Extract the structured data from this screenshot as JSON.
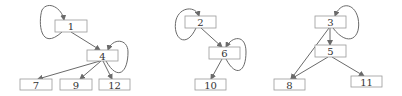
{
  "diagram": {
    "type": "directed-graph",
    "colors": {
      "node_border": "#9a9a9a",
      "edge": "#6a6a6a",
      "text": "#333333",
      "background": "#ffffff"
    },
    "graphs": [
      {
        "nodes": [
          {
            "id": "1",
            "label": "1",
            "x": 55,
            "y": 20
          },
          {
            "id": "4",
            "label": "4",
            "x": 87,
            "y": 50
          },
          {
            "id": "7",
            "label": "7",
            "x": 20,
            "y": 79
          },
          {
            "id": "9",
            "label": "9",
            "x": 60,
            "y": 79
          },
          {
            "id": "12",
            "label": "12",
            "x": 99,
            "y": 79
          }
        ],
        "edges": [
          {
            "from": "1",
            "to": "1",
            "self_loop": true
          },
          {
            "from": "1",
            "to": "4"
          },
          {
            "from": "4",
            "to": "4",
            "self_loop": true
          },
          {
            "from": "4",
            "to": "7"
          },
          {
            "from": "4",
            "to": "9"
          },
          {
            "from": "4",
            "to": "12"
          }
        ]
      },
      {
        "nodes": [
          {
            "id": "2",
            "label": "2",
            "x": 185,
            "y": 16
          },
          {
            "id": "6",
            "label": "6",
            "x": 209,
            "y": 47
          },
          {
            "id": "10",
            "label": "10",
            "x": 195,
            "y": 79
          }
        ],
        "edges": [
          {
            "from": "2",
            "to": "2",
            "self_loop": true
          },
          {
            "from": "2",
            "to": "6"
          },
          {
            "from": "6",
            "to": "6",
            "self_loop": true
          },
          {
            "from": "6",
            "to": "10"
          }
        ]
      },
      {
        "nodes": [
          {
            "id": "3",
            "label": "3",
            "x": 315,
            "y": 16
          },
          {
            "id": "5",
            "label": "5",
            "x": 315,
            "y": 45
          },
          {
            "id": "8",
            "label": "8",
            "x": 274,
            "y": 79
          },
          {
            "id": "11",
            "label": "11",
            "x": 351,
            "y": 76
          }
        ],
        "edges": [
          {
            "from": "3",
            "to": "3",
            "self_loop": true
          },
          {
            "from": "3",
            "to": "5"
          },
          {
            "from": "3",
            "to": "8"
          },
          {
            "from": "5",
            "to": "8"
          },
          {
            "from": "5",
            "to": "11"
          }
        ]
      }
    ]
  },
  "labels": {
    "n1": "1",
    "n4": "4",
    "n7": "7",
    "n9": "9",
    "n12": "12",
    "n2": "2",
    "n6": "6",
    "n10": "10",
    "n3": "3",
    "n5": "5",
    "n8": "8",
    "n11": "11"
  }
}
